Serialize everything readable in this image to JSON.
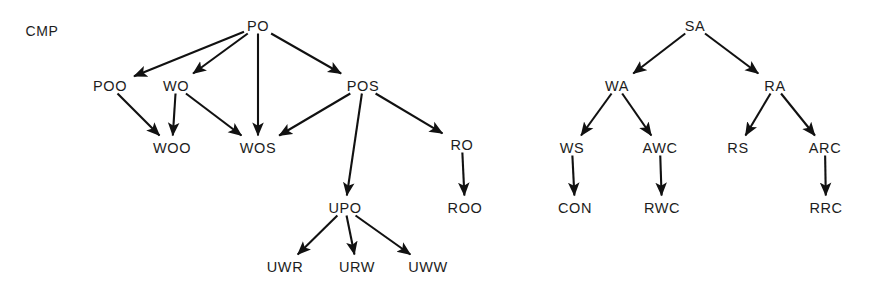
{
  "canvas": {
    "width": 873,
    "height": 293,
    "background": "#ffffff",
    "stroke_color": "#111111",
    "text_color": "#1d1d1d"
  },
  "caption": {
    "text": "CMP",
    "x": 42,
    "y": 31
  },
  "graphs": [
    {
      "name": "cmp-tree-left",
      "root": "PO",
      "nodes": [
        {
          "id": "PO",
          "label": "PO",
          "x": 258,
          "y": 26,
          "w": 22,
          "h": 9
        },
        {
          "id": "POO",
          "label": "POO",
          "x": 110,
          "y": 86,
          "w": 32,
          "h": 9
        },
        {
          "id": "WO",
          "label": "WO",
          "x": 176,
          "y": 86,
          "w": 25,
          "h": 9
        },
        {
          "id": "POS",
          "label": "POS",
          "x": 363,
          "y": 86,
          "w": 30,
          "h": 9
        },
        {
          "id": "WOO",
          "label": "WOO",
          "x": 172,
          "y": 148,
          "w": 34,
          "h": 9
        },
        {
          "id": "WOS",
          "label": "WOS",
          "x": 258,
          "y": 148,
          "w": 33,
          "h": 9
        },
        {
          "id": "RO",
          "label": "RO",
          "x": 462,
          "y": 145,
          "w": 23,
          "h": 9
        },
        {
          "id": "UPO",
          "label": "UPO",
          "x": 345,
          "y": 208,
          "w": 32,
          "h": 9
        },
        {
          "id": "ROO",
          "label": "ROO",
          "x": 465,
          "y": 208,
          "w": 33,
          "h": 9
        },
        {
          "id": "UWR",
          "label": "UWR",
          "x": 285,
          "y": 267,
          "w": 34,
          "h": 9
        },
        {
          "id": "URW",
          "label": "URW",
          "x": 357,
          "y": 267,
          "w": 34,
          "h": 9
        },
        {
          "id": "UWW",
          "label": "UWW",
          "x": 428,
          "y": 267,
          "w": 37,
          "h": 9
        }
      ],
      "edges": [
        {
          "from": "PO",
          "to": "POO"
        },
        {
          "from": "PO",
          "to": "WO"
        },
        {
          "from": "PO",
          "to": "WOS"
        },
        {
          "from": "PO",
          "to": "POS"
        },
        {
          "from": "POO",
          "to": "WOO"
        },
        {
          "from": "WO",
          "to": "WOO"
        },
        {
          "from": "WO",
          "to": "WOS"
        },
        {
          "from": "POS",
          "to": "WOS"
        },
        {
          "from": "POS",
          "to": "UPO"
        },
        {
          "from": "POS",
          "to": "RO"
        },
        {
          "from": "RO",
          "to": "ROO"
        },
        {
          "from": "UPO",
          "to": "UWR"
        },
        {
          "from": "UPO",
          "to": "URW"
        },
        {
          "from": "UPO",
          "to": "UWW"
        }
      ]
    },
    {
      "name": "cmp-tree-right",
      "root": "SA",
      "nodes": [
        {
          "id": "SA",
          "label": "SA",
          "x": 695,
          "y": 26,
          "w": 22,
          "h": 9
        },
        {
          "id": "WA",
          "label": "WA",
          "x": 617,
          "y": 86,
          "w": 25,
          "h": 9
        },
        {
          "id": "RA",
          "label": "RA",
          "x": 775,
          "y": 86,
          "w": 23,
          "h": 9
        },
        {
          "id": "WS",
          "label": "WS",
          "x": 572,
          "y": 148,
          "w": 23,
          "h": 9
        },
        {
          "id": "AWC",
          "label": "AWC",
          "x": 660,
          "y": 148,
          "w": 33,
          "h": 9
        },
        {
          "id": "RS",
          "label": "RS",
          "x": 738,
          "y": 148,
          "w": 21,
          "h": 9
        },
        {
          "id": "ARC",
          "label": "ARC",
          "x": 825,
          "y": 148,
          "w": 32,
          "h": 9
        },
        {
          "id": "CON",
          "label": "CON",
          "x": 575,
          "y": 208,
          "w": 33,
          "h": 9
        },
        {
          "id": "RWC",
          "label": "RWC",
          "x": 662,
          "y": 208,
          "w": 34,
          "h": 9
        },
        {
          "id": "RRC",
          "label": "RRC",
          "x": 826,
          "y": 208,
          "w": 32,
          "h": 9
        }
      ],
      "edges": [
        {
          "from": "SA",
          "to": "WA"
        },
        {
          "from": "SA",
          "to": "RA"
        },
        {
          "from": "WA",
          "to": "WS"
        },
        {
          "from": "WA",
          "to": "AWC"
        },
        {
          "from": "RA",
          "to": "RS"
        },
        {
          "from": "RA",
          "to": "ARC"
        },
        {
          "from": "WS",
          "to": "CON"
        },
        {
          "from": "AWC",
          "to": "RWC"
        },
        {
          "from": "ARC",
          "to": "RRC"
        }
      ]
    }
  ]
}
